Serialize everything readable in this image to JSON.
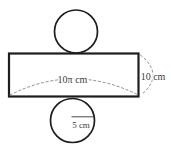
{
  "diagram": {
    "type": "cylinder-net",
    "labels": {
      "circumference": "10π cm",
      "height": "10 cm",
      "radius": "5 cm"
    },
    "colors": {
      "background": "#ffffff",
      "outline": "#1d1d1d",
      "dashed_line": "#8e8e8e",
      "label_text": "#3c3c3c"
    }
  }
}
